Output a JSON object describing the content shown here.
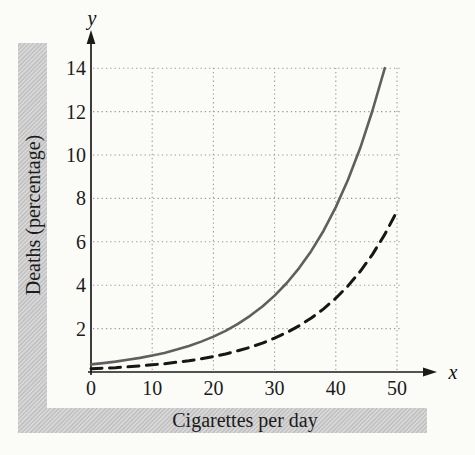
{
  "figure": {
    "y_axis_title": "Deaths (percentage)",
    "x_axis_title": "Cigarettes per day",
    "y_var": "y",
    "x_var": "x",
    "band_color": "#c7c7c7",
    "background": "#fbfbf8",
    "axis_color": "#1a1a1a",
    "grid_color": "#9a9a9a"
  },
  "chart_data": {
    "type": "line",
    "title": "",
    "xlabel": "Cigarettes per day",
    "ylabel": "Deaths (percentage)",
    "xlim": [
      0,
      55
    ],
    "ylim": [
      0,
      15
    ],
    "x_ticks": [
      0,
      10,
      20,
      30,
      40,
      50
    ],
    "y_ticks": [
      2,
      4,
      6,
      8,
      10,
      12,
      14
    ],
    "grid": "dotted, both directions at every labeled tick",
    "legend": "none",
    "series": [
      {
        "name": "solid gray exponential curve",
        "style": "solid",
        "color": "#5f5f5f",
        "x": [
          0,
          2,
          4,
          6,
          8,
          10,
          12,
          14,
          16,
          18,
          20,
          22,
          24,
          26,
          28,
          30,
          32,
          34,
          36,
          38,
          40,
          42,
          44,
          46,
          48
        ],
        "y": [
          0.35,
          0.41,
          0.48,
          0.56,
          0.65,
          0.76,
          0.88,
          1.03,
          1.2,
          1.4,
          1.63,
          1.9,
          2.22,
          2.59,
          3.02,
          3.52,
          4.1,
          4.79,
          5.58,
          6.51,
          7.6,
          8.86,
          10.33,
          12.05,
          14.0
        ]
      },
      {
        "name": "dashed black exponential curve",
        "style": "dashed",
        "color": "#161616",
        "x": [
          0,
          2,
          4,
          6,
          8,
          10,
          12,
          14,
          16,
          18,
          20,
          22,
          24,
          26,
          28,
          30,
          32,
          34,
          36,
          38,
          40,
          42,
          44,
          46,
          48,
          50
        ],
        "y": [
          0.15,
          0.18,
          0.2,
          0.24,
          0.28,
          0.33,
          0.38,
          0.45,
          0.52,
          0.61,
          0.71,
          0.83,
          0.98,
          1.14,
          1.33,
          1.56,
          1.82,
          2.13,
          2.49,
          2.91,
          3.4,
          3.97,
          4.64,
          5.42,
          6.34,
          7.41
        ]
      }
    ]
  }
}
